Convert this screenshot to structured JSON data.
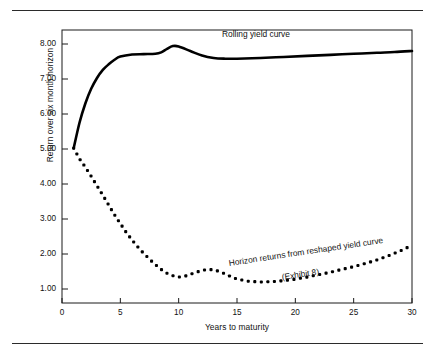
{
  "figure": {
    "has_top_rule": true,
    "has_bottom_rule": true,
    "background": "#ffffff",
    "line_color": "#000000"
  },
  "chart_data": {
    "type": "line",
    "title": "",
    "xlabel": "Years to maturity",
    "ylabel": "Return over six month horizon",
    "xlim": [
      0,
      30
    ],
    "ylim": [
      0.6,
      8.4
    ],
    "xticks": [
      "0",
      "5",
      "10",
      "15",
      "20",
      "25",
      "30"
    ],
    "xtick_values": [
      0,
      5,
      10,
      15,
      20,
      25,
      30
    ],
    "yticks": [
      "1.00",
      "2.00",
      "3.00",
      "4.00",
      "5.00",
      "6.00",
      "7.00",
      "8.00"
    ],
    "ytick_values": [
      1,
      2,
      3,
      4,
      5,
      6,
      7,
      8
    ],
    "grid": false,
    "legend_position": "inline-annotations",
    "annotations": [
      {
        "text": "Rolling yield curve",
        "x": 19.5,
        "y": 8.05
      },
      {
        "text": "Horizon returns from reshaped yield curve",
        "x": 16.2,
        "y": 1.15
      },
      {
        "text": "(Exhibit 8)",
        "x": 20.8,
        "y": 0.95
      }
    ],
    "series": [
      {
        "name": "Rolling yield curve",
        "style": "solid",
        "linewidth": 2.6,
        "x": [
          1,
          1.5,
          2,
          2.5,
          3,
          3.5,
          4,
          4.5,
          5,
          6,
          7,
          8,
          8.5,
          9,
          9.5,
          10,
          11,
          12,
          13,
          14,
          15,
          17,
          19,
          21,
          23,
          25,
          27,
          28.5,
          30
        ],
        "y": [
          5.02,
          5.75,
          6.3,
          6.72,
          7.03,
          7.26,
          7.42,
          7.55,
          7.64,
          7.7,
          7.71,
          7.72,
          7.76,
          7.86,
          7.94,
          7.93,
          7.8,
          7.67,
          7.6,
          7.58,
          7.58,
          7.6,
          7.63,
          7.66,
          7.69,
          7.72,
          7.75,
          7.77,
          7.8
        ]
      },
      {
        "name": "Horizon returns from reshaped yield curve",
        "style": "dotted",
        "marker_size": 3.1,
        "x": [
          1,
          1.5,
          2,
          2.5,
          3,
          3.5,
          4,
          4.5,
          5,
          5.5,
          6,
          6.5,
          7,
          7.5,
          8,
          8.5,
          9,
          9.5,
          10,
          10.5,
          11,
          11.5,
          12,
          12.5,
          13,
          13.5,
          14,
          14.5,
          15,
          16,
          17,
          18,
          19,
          20,
          21,
          22,
          23,
          24,
          25,
          26,
          27,
          28,
          29,
          30
        ],
        "y": [
          5.02,
          4.72,
          4.48,
          4.22,
          3.95,
          3.68,
          3.4,
          3.12,
          2.87,
          2.62,
          2.4,
          2.2,
          2.02,
          1.85,
          1.7,
          1.56,
          1.45,
          1.38,
          1.34,
          1.36,
          1.42,
          1.48,
          1.53,
          1.56,
          1.55,
          1.5,
          1.43,
          1.35,
          1.28,
          1.22,
          1.2,
          1.21,
          1.24,
          1.28,
          1.34,
          1.41,
          1.48,
          1.56,
          1.64,
          1.73,
          1.83,
          1.95,
          2.09,
          2.25
        ]
      }
    ]
  }
}
